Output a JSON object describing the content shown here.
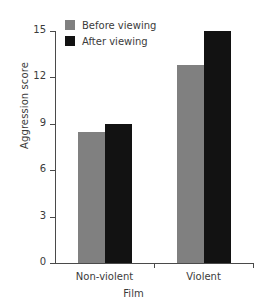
{
  "chart_data": {
    "type": "bar",
    "title": "",
    "subtitle": "",
    "xlabel": "Film",
    "ylabel": "Aggression score",
    "categories": [
      "Non-violent",
      "Violent"
    ],
    "series": [
      {
        "name": "Before viewing",
        "values": [
          8.5,
          12.8
        ],
        "color": "#808080"
      },
      {
        "name": "After viewing",
        "values": [
          9.0,
          15.0
        ],
        "color": "#121212"
      }
    ],
    "ylim": [
      0,
      15
    ],
    "yticks": [
      0,
      3,
      6,
      9,
      12,
      15
    ],
    "ytick_labels": [
      "0",
      "3",
      "6",
      "9",
      "12",
      "15"
    ],
    "grid": false,
    "legend_position": "top-left-inside"
  },
  "legend": {
    "items": [
      {
        "label": "Before viewing",
        "color": "#808080"
      },
      {
        "label": "After viewing",
        "color": "#121212"
      }
    ]
  },
  "axes": {
    "y_label": "Aggression score",
    "x_label": "Film",
    "axis_color": "#4a4a4a",
    "text_color": "#3b3b3b"
  }
}
